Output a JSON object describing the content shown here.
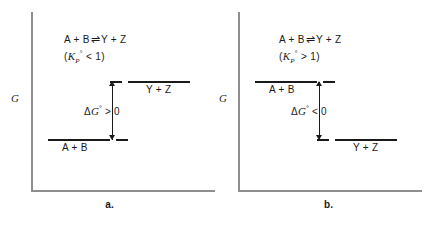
{
  "figure": {
    "axis_y_label": "G",
    "line_color": "#1a1a1a",
    "axis_color": "#8e8e8e"
  },
  "panels": [
    {
      "caption": "a.",
      "reaction": {
        "reactants": "A + B",
        "arrow": "⇌",
        "products": "Y + Z",
        "k_open": "(",
        "k_symbol": "K",
        "k_subscript": "P",
        "k_superscript": "°",
        "k_relation": "< 1",
        "k_close": ")"
      },
      "upper_level_label": "Y + Z",
      "lower_level_label": "A + B",
      "delta_label": "ΔG° > 0",
      "delta_symbol": "Δ",
      "delta_g": "G",
      "delta_sup": "°",
      "delta_relation": "> 0"
    },
    {
      "caption": "b.",
      "reaction": {
        "reactants": "A + B",
        "arrow": "⇌",
        "products": "Y + Z",
        "k_open": "(",
        "k_symbol": "K",
        "k_subscript": "P",
        "k_superscript": "°",
        "k_relation": "> 1",
        "k_close": ")"
      },
      "upper_level_label": "A + B",
      "lower_level_label": "Y + Z",
      "delta_label": "ΔG° < 0",
      "delta_symbol": "Δ",
      "delta_g": "G",
      "delta_sup": "°",
      "delta_relation": "< 0"
    }
  ]
}
